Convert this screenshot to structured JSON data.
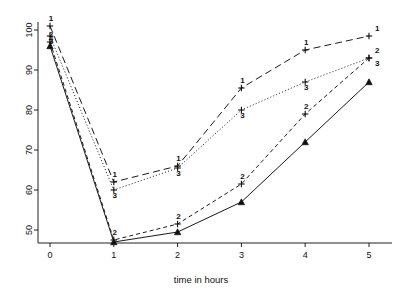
{
  "chart_data": {
    "type": "line",
    "title": "",
    "subtitle": "",
    "xlabel": "time in hours",
    "ylabel": "",
    "x": [
      0,
      1,
      2,
      3,
      4,
      5
    ],
    "xlim": [
      -0.25,
      5.35
    ],
    "ylim": [
      44,
      103
    ],
    "grid": false,
    "legend": "none",
    "xticks": [
      "0",
      "1",
      "2",
      "3",
      "4",
      "5"
    ],
    "yticks": [
      "50",
      "60",
      "70",
      "80",
      "90",
      "100"
    ],
    "xtick_values": [
      0,
      1,
      2,
      3,
      4,
      5
    ],
    "ytick_values": [
      50,
      60,
      70,
      80,
      90,
      100
    ],
    "series": [
      {
        "name": "1",
        "marker_label": "1",
        "linestyle": "long-dash",
        "dasharray": "7,4",
        "marker": "plus",
        "values": [
          101,
          62,
          66,
          85.5,
          95,
          98.5
        ]
      },
      {
        "name": "2",
        "marker_label": "2",
        "linestyle": "short-dash",
        "dasharray": "4,3",
        "marker": "plus",
        "values": [
          97,
          47.5,
          51.5,
          61.5,
          79,
          93
        ]
      },
      {
        "name": "3",
        "marker_label": "3",
        "linestyle": "dotted",
        "dasharray": "1,2.2",
        "marker": "plus",
        "values": [
          98.5,
          60,
          65.5,
          80,
          87,
          93
        ]
      },
      {
        "name": "4",
        "marker_label": "4",
        "linestyle": "solid",
        "dasharray": "none",
        "marker": "triangle",
        "values": [
          96,
          47,
          49.5,
          57,
          72,
          87
        ]
      }
    ],
    "colors": {
      "axis": "#222222",
      "line": "#1a1a1a",
      "text": "#111111",
      "background": "#ffffff"
    }
  }
}
